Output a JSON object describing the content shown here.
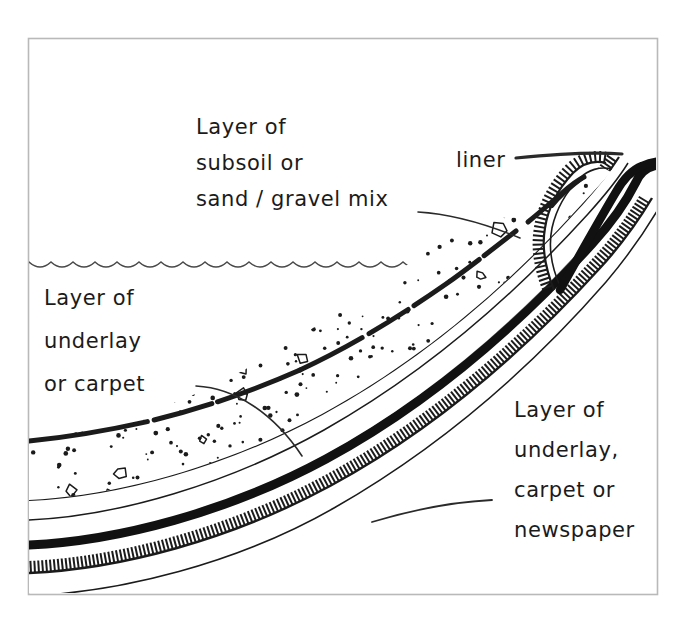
{
  "figure": {
    "kind": "hand-drawn-cross-section",
    "background_color": "#ffffff",
    "ink_color": "#1b1b1b",
    "frame": {
      "name": "image-border",
      "color": "#b9b9b9",
      "x": 28,
      "y": 38,
      "width": 629,
      "height": 556
    }
  },
  "labels": {
    "subsoil": {
      "name": "label-subsoil",
      "lines": [
        "Layer of",
        "subsoil  or",
        "sand / gravel mix"
      ],
      "x": 196,
      "y": 134,
      "line_height": 36
    },
    "liner": {
      "name": "label-liner",
      "lines": [
        "liner"
      ],
      "x": 456,
      "y": 167,
      "line_height": 36
    },
    "underlay_left": {
      "name": "label-underlay-carpet",
      "lines": [
        "Layer of",
        "underlay",
        "or carpet"
      ],
      "x": 44,
      "y": 305,
      "line_height": 43
    },
    "underlay_right": {
      "name": "label-underlay-carpet-newspaper",
      "lines": [
        "Layer of",
        "underlay,",
        "carpet or",
        "newspaper"
      ],
      "x": 514,
      "y": 417,
      "line_height": 40
    }
  },
  "layers": [
    {
      "name": "water-surface",
      "label": "water surface",
      "style": "thin wavy line",
      "stroke": "#3a3a3a"
    },
    {
      "name": "subsoil-layer",
      "label": "Layer of subsoil or sand / gravel mix",
      "style": "stippled with pebble outlines",
      "stroke": "#1b1b1b"
    },
    {
      "name": "upper-underlay-layer",
      "label": "Layer of underlay or carpet",
      "style": "hatched comb band",
      "stroke": "#1b1b1b"
    },
    {
      "name": "liner-layer",
      "label": "liner",
      "style": "thick solid black band",
      "stroke": "#111111"
    },
    {
      "name": "lower-underlay-layer",
      "label": "Layer of underlay, carpet or newspaper",
      "style": "hatched comb band",
      "stroke": "#1b1b1b"
    }
  ],
  "leaders": [
    {
      "name": "leader-subsoil",
      "from": "label-subsoil",
      "to": "subsoil-layer"
    },
    {
      "name": "leader-liner",
      "from": "label-liner",
      "to": "liner-layer"
    },
    {
      "name": "leader-underlay-left",
      "from": "label-underlay-carpet",
      "to": "upper-underlay-layer"
    },
    {
      "name": "leader-newspaper",
      "from": "label-underlay-carpet-newspaper",
      "to": "lower-underlay-layer"
    }
  ]
}
